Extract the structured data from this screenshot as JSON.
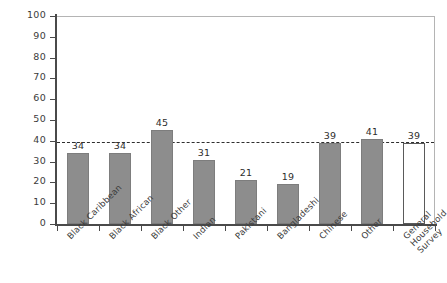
{
  "chart_data": {
    "type": "bar",
    "title": "",
    "subtitle": "",
    "xlabel": "",
    "ylabel": "Percentage",
    "ylim": [
      0,
      100
    ],
    "yticks": [
      0,
      10,
      20,
      30,
      40,
      50,
      60,
      70,
      80,
      90,
      100
    ],
    "ytick_labels": [
      "0",
      "10",
      "20",
      "30",
      "40",
      "50",
      "60",
      "70",
      "80",
      "90",
      "100"
    ],
    "grid": false,
    "legend": "none",
    "categories": [
      "Black Caribbean",
      "Black African",
      "Black Other",
      "Indian",
      "Pakistani",
      "Bangladeshi",
      "Chinese",
      "Other",
      "General\nHousehold\nSurvey"
    ],
    "values": [
      34,
      34,
      45,
      31,
      21,
      19,
      39,
      41,
      39
    ],
    "value_labels": [
      "34",
      "34",
      "45",
      "31",
      "21",
      "19",
      "39",
      "41",
      "39"
    ],
    "bar_styles": [
      "filled",
      "filled",
      "filled",
      "filled",
      "filled",
      "filled",
      "filled",
      "filled",
      "open"
    ],
    "annotations": [
      {
        "name": "reference-line",
        "kind": "horizontal-dashed-line",
        "value": 40,
        "style": "dashed"
      }
    ],
    "colors": {
      "bar_fill": "#8d8d8d",
      "bar_edge": "#7d7d7d",
      "open_bar_fill": "#ffffff",
      "open_bar_edge": "#5a5a5a",
      "axis": "#4a4a4a",
      "frame": "#b4b4b4",
      "text": "#3b3b3b",
      "reference_line": "#2e2e2e",
      "background": "#ffffff"
    }
  }
}
